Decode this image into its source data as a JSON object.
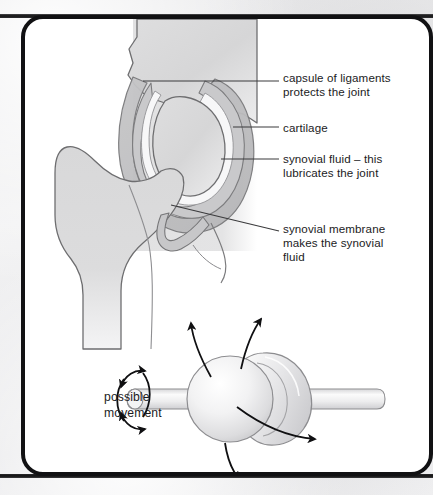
{
  "figure": {
    "text_color": "#1b1b1d",
    "frame_color": "#111113",
    "page_background": "#ffffff",
    "outer_background": "#ececed"
  },
  "labels": {
    "capsule": "capsule of ligaments\nprotects the joint",
    "cartilage": "cartilage",
    "synovial_fluid": "synovial fluid – this\nlubricates the joint",
    "synovial_membrane": "synovial membrane\nmakes the synovial\nfluid",
    "possible_movement": "possible\nmovement"
  },
  "anatomy": {
    "bone_fill": "#d9d9da",
    "bone_stroke": "#6e6e70",
    "capsule_fill": "#c3c3c5",
    "cartilage_fill": "#c9c9cb",
    "synovial_fluid_fill": "#f7f7f8",
    "shade_block_fill": "#e3e3e4",
    "leader_line_color": "#3a3a3c",
    "parts": [
      "pelvis / acetabulum",
      "femoral head",
      "femur neck",
      "femur shaft",
      "greater trochanter",
      "joint capsule",
      "articular cartilage",
      "synovial cavity",
      "synovial membrane"
    ]
  },
  "movement_diagram": {
    "ball_fill": "#ececee",
    "ball_highlight": "#ffffff",
    "rod_fill": "#f0f0f1",
    "socket_fill": "#e4e4e6",
    "outline_color": "#8d8d90",
    "arrow_color": "#101012",
    "arrows": [
      "rotation about the long axis",
      "flexion upward left",
      "flexion upward right",
      "abduction downward",
      "circumduction to the right"
    ]
  }
}
